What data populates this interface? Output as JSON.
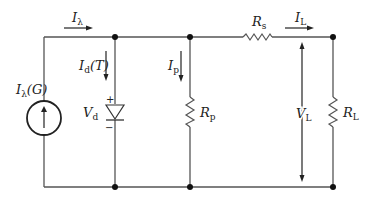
{
  "diagram": {
    "colors": {
      "wire": "#555555",
      "node": "#111111",
      "text": "#222222"
    },
    "labels": {
      "source_main": "I",
      "source_sub": "λ",
      "source_arg": "(G)",
      "i_lambda_main": "I",
      "i_lambda_sub": "λ",
      "i_d_main": "I",
      "i_d_sub": "d",
      "i_d_arg": "(T)",
      "v_d_main": "V",
      "v_d_sub": "d",
      "diode_plus": "+",
      "diode_minus": "−",
      "i_p_main": "I",
      "i_p_sub": "p",
      "r_p_main": "R",
      "r_p_sub": "p",
      "r_s_main": "R",
      "r_s_sub": "s",
      "i_l_main": "I",
      "i_l_sub": "L",
      "v_l_main": "V",
      "v_l_sub": "L",
      "r_l_main": "R",
      "r_l_sub": "L"
    },
    "components": [
      {
        "id": "current-source",
        "type": "current_source",
        "label": "Iλ(G)"
      },
      {
        "id": "diode",
        "type": "diode",
        "label": "Vd",
        "current": "Id(T)"
      },
      {
        "id": "shunt-resistor",
        "type": "resistor",
        "label": "Rp",
        "current": "Ip"
      },
      {
        "id": "series-resistor",
        "type": "resistor",
        "label": "Rs"
      },
      {
        "id": "load-resistor",
        "type": "resistor",
        "label": "RL",
        "voltage": "VL",
        "current": "IL"
      }
    ]
  }
}
